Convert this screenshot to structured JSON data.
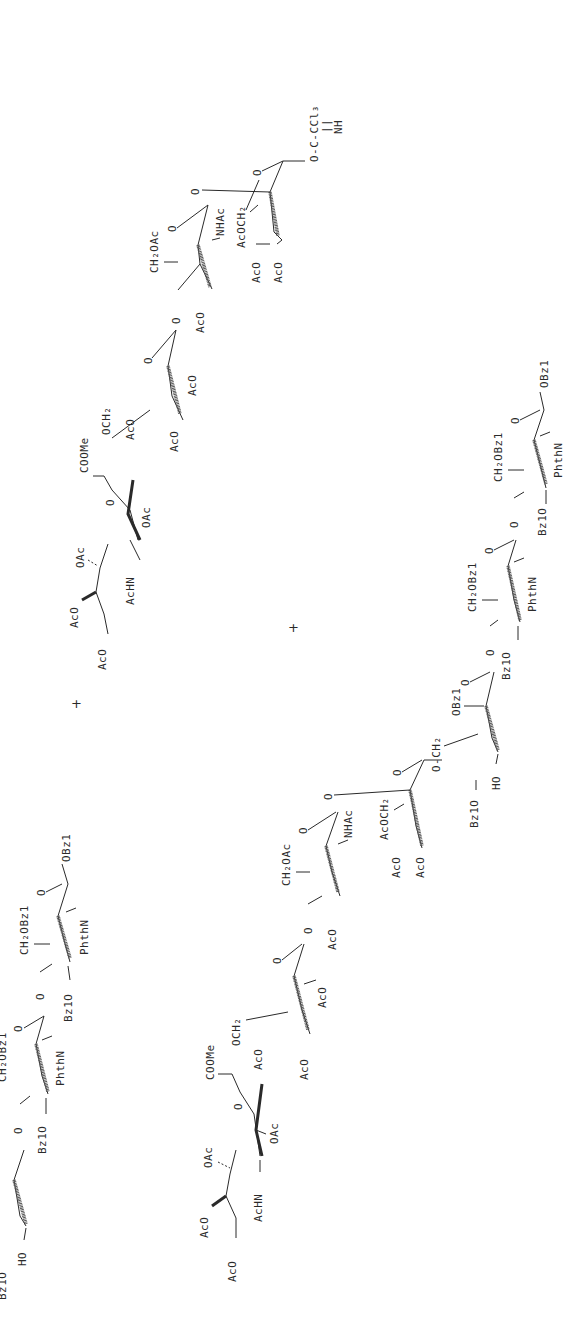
{
  "figure": {
    "type": "chemical-reaction-scheme",
    "orientation": "rotated-90-ccw",
    "operators": [
      "+",
      "+"
    ]
  },
  "donor": {
    "name": "sialyl-oligosaccharide trichloroacetimidate donor",
    "leaving_group": {
      "line1": "O-C-CCl₃",
      "line2": "NH",
      "double_bond": "||"
    },
    "sialic_acid": {
      "labels": [
        "AcO",
        "AcO",
        "OAc",
        "AcHN",
        "OAc",
        "COOMe",
        "O",
        "OCH₂"
      ]
    },
    "galactose": {
      "labels": [
        "AcO",
        "AcO",
        "AcO",
        "O",
        "O"
      ]
    },
    "glcnac": {
      "labels": [
        "CH₂OAc",
        "O",
        "NHAc",
        "AcO",
        "O"
      ]
    },
    "mannose": {
      "labels": [
        "O",
        "AcOCH₂",
        "AcO",
        "AcO"
      ]
    }
  },
  "acceptor_left": {
    "labels": [
      "OBz1",
      "CH₂OBz1",
      "O",
      "PhthN",
      "Bz1O",
      "O",
      "CH₂OBz1",
      "O",
      "PhthN",
      "Bz1O",
      "O",
      "HO",
      "Bz1O"
    ]
  },
  "product": {
    "reducing_end": {
      "labels": [
        "OBz1",
        "CH₂OBz1",
        "O",
        "PhthN",
        "Bz1O",
        "O",
        "CH₂OBz1",
        "O",
        "PhthN",
        "Bz1O",
        "O"
      ]
    },
    "branch_mannose": {
      "labels": [
        "OBz1",
        "O",
        "O-CH₂",
        "HO",
        "Bz1O"
      ]
    },
    "mannose": {
      "labels": [
        "O",
        "AcOCH₂",
        "AcO",
        "AcO"
      ]
    },
    "glcnac": {
      "labels": [
        "O",
        "NHAc",
        "CH₂OAc",
        "O",
        "AcO",
        "O"
      ]
    },
    "galactose": {
      "labels": [
        "O",
        "AcO",
        "OCH₂",
        "AcO",
        "AcO"
      ]
    },
    "sialic_acid": {
      "labels": [
        "COOMe",
        "O",
        "OAc",
        "AcHN",
        "OAc",
        "AcO",
        "AcO"
      ]
    }
  }
}
